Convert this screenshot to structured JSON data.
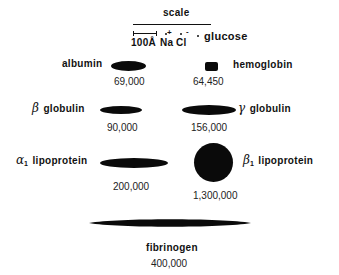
{
  "scale": {
    "title": "scale",
    "bar_label": "100Å",
    "ions": [
      "Na",
      "Cl"
    ],
    "ion_charges": [
      "+",
      "-"
    ],
    "glucose_label": "glucose"
  },
  "molecules": [
    {
      "name": "albumin",
      "prefix": "",
      "subscript": "",
      "weight": "69,000",
      "shape": "ellipse"
    },
    {
      "name": "hemoglobin",
      "prefix": "",
      "subscript": "",
      "weight": "64,450",
      "shape": "rounded-square"
    },
    {
      "name": "globulin",
      "prefix": "β",
      "subscript": "",
      "weight": "90,000",
      "shape": "ellipse"
    },
    {
      "name": "globulin",
      "prefix": "γ",
      "subscript": "",
      "weight": "156,000",
      "shape": "ellipse"
    },
    {
      "name": "lipoprotein",
      "prefix": "α",
      "subscript": "1",
      "weight": "200,000",
      "shape": "ellipse"
    },
    {
      "name": "lipoprotein",
      "prefix": "β",
      "subscript": "1",
      "weight": "1,300,000",
      "shape": "circle"
    },
    {
      "name": "fibrinogen",
      "prefix": "",
      "subscript": "",
      "weight": "400,000",
      "shape": "spindle"
    }
  ]
}
